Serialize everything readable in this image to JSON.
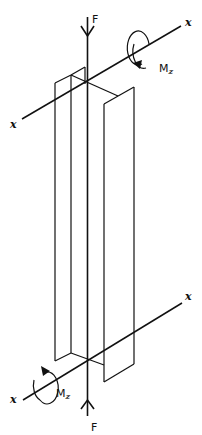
{
  "diagram": {
    "colors": {
      "ink": "#111111",
      "background": "#ffffff"
    },
    "labels": {
      "force_top": "F",
      "force_bottom": "F",
      "moment_top_main": "M",
      "moment_top_sub": "z",
      "moment_bottom_main": "M",
      "moment_bottom_sub": "z",
      "axis_top_left": "x",
      "axis_top_right": "x",
      "axis_bottom_left": "x",
      "axis_bottom_right": "x"
    },
    "elements": [
      {
        "name": "i-beam",
        "kind": "wireframe I-section column"
      },
      {
        "name": "force-top",
        "label": "F",
        "direction": "down"
      },
      {
        "name": "force-bottom",
        "label": "F",
        "direction": "up"
      },
      {
        "name": "x-axis-top",
        "label": "x"
      },
      {
        "name": "x-axis-bottom",
        "label": "x"
      },
      {
        "name": "moment-top",
        "label": "Mz"
      },
      {
        "name": "moment-bottom",
        "label": "Mz"
      }
    ]
  }
}
